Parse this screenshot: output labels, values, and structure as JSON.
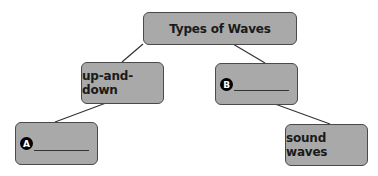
{
  "diagram": {
    "type": "concept-map",
    "root": {
      "label": "Types of Waves"
    },
    "children": [
      {
        "label": "up-and-down",
        "children": [
          {
            "label": "",
            "marker": "A",
            "blank": true
          }
        ]
      },
      {
        "label": "",
        "marker": "B",
        "blank": true,
        "children": [
          {
            "label": "sound waves"
          }
        ]
      }
    ],
    "colors": {
      "node_fill": "#a9a9a9",
      "node_border": "#4a4a4a",
      "line": "#333333",
      "badge": "#000000"
    }
  },
  "nodes": {
    "root": "Types of Waves",
    "up_and_down": "up-and-down",
    "b_marker": "B",
    "a_marker": "A",
    "sound_waves": "sound waves"
  }
}
